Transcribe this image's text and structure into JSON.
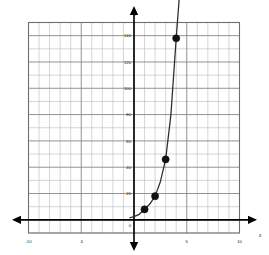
{
  "chart_data": {
    "type": "line",
    "title": "",
    "subtitle": "",
    "xlabel": "x",
    "ylabel": "y",
    "xlim": [
      -10,
      10
    ],
    "ylim": [
      -10,
      150
    ],
    "grid": true,
    "legend": null,
    "x_ticks": [
      -10,
      -5,
      5,
      10
    ],
    "x_tick_labels": [
      "-10",
      "-5",
      "5",
      "10"
    ],
    "y_ticks": [
      20,
      40,
      60,
      80,
      100,
      120,
      140
    ],
    "y_tick_labels": [
      "20",
      "40",
      "60",
      "80",
      "100",
      "120",
      "140"
    ],
    "origin_label": "0",
    "x_minor_step": 1,
    "y_minor_step": 10,
    "x_major_step": 5,
    "y_major_step": 20,
    "series": [
      {
        "name": "exponential curve",
        "type": "line",
        "color": "#2b2b2b",
        "x": [
          -0.4,
          0,
          0.5,
          1,
          1.5,
          2,
          2.5,
          3,
          3.5,
          4,
          4.35
        ],
        "values": [
          1.6,
          2.5,
          4.2,
          8,
          12,
          18,
          29,
          46,
          80,
          138,
          175
        ]
      },
      {
        "name": "plotted points",
        "type": "scatter",
        "color": "#111111",
        "x": [
          1,
          2,
          3,
          4
        ],
        "values": [
          8,
          18,
          46,
          138
        ]
      }
    ],
    "points": [
      {
        "x": 1,
        "y": 8
      },
      {
        "x": 2,
        "y": 18
      },
      {
        "x": 3,
        "y": 46
      },
      {
        "x": 4,
        "y": 138
      }
    ],
    "colors": {
      "curve": "#2b2b2b",
      "point": "#111111",
      "axis": "#000000",
      "grid_major": "#8c8c8c",
      "grid_minor": "#b8b8b8",
      "frame": "#6f6f6f",
      "background": "#ffffff"
    }
  }
}
